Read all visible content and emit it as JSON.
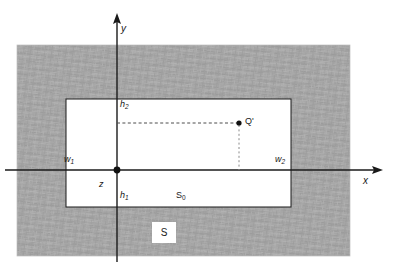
{
  "figure": {
    "background_color": "#ffffff",
    "shaded_region_color": "#a3a3a3",
    "inner_region_color": "#ffffff",
    "line_color": "#1a1a1a",
    "dashed_color": "#555555",
    "axes": {
      "x_label": "x",
      "y_label": "y",
      "origin_label": "z"
    },
    "labels": {
      "h2": {
        "base": "h",
        "sub": "2"
      },
      "h1": {
        "base": "h",
        "sub": "1"
      },
      "w1": {
        "base": "w",
        "sub": "1"
      },
      "w2": {
        "base": "w",
        "sub": "2"
      },
      "s0": {
        "base": "S",
        "sub": "0"
      },
      "s": "S",
      "q_point": "Q'",
      "origin": "z"
    },
    "geometry": {
      "shaded_rect": {
        "x": 17,
        "y": 45,
        "width": 333,
        "height": 211
      },
      "inner_rect": {
        "x": 66,
        "y": 99,
        "width": 225,
        "height": 108
      },
      "origin": {
        "x": 117,
        "y": 170
      },
      "q_point": {
        "x": 239,
        "y": 123
      },
      "x_axis": {
        "x1": 5,
        "y1": 170,
        "x2": 383,
        "y2": 170
      },
      "y_axis": {
        "x1": 117,
        "y1": 13,
        "x2": 117,
        "y2": 262
      },
      "s_box": {
        "x": 152,
        "y": 222,
        "width": 24,
        "height": 21
      }
    }
  }
}
